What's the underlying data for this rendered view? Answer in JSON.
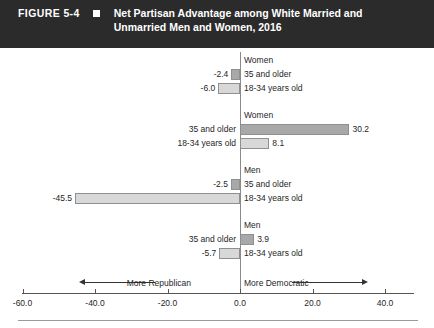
{
  "header": {
    "figure_label": "FIGURE 5-4",
    "marker_icon": "square-bullet-icon",
    "title": "Net Partisan Advantage among White Married and Unmarried Men and Women, 2016",
    "background_color": "#2b2b2b",
    "text_color": "#ffffff"
  },
  "axis_annotation": {
    "left_label": "More Republican",
    "right_label": "More Democratic",
    "left_arrow_icon": "arrow-left-icon",
    "right_arrow_icon": "arrow-right-icon"
  },
  "chart_data": {
    "type": "bar",
    "orientation": "horizontal",
    "title": "Net Partisan Advantage among White Married and Unmarried Men and Women, 2016",
    "xlabel": "",
    "ylabel": "",
    "xlim": [
      -60.0,
      48.0
    ],
    "xticks": [
      -60.0,
      -40.0,
      -20.0,
      0.0,
      20.0,
      40.0
    ],
    "xticklabels": [
      "-60.0",
      "-40.0",
      "-20.0",
      "0.0",
      "20.0",
      "40.0"
    ],
    "grid": false,
    "legend": "none",
    "zero_reference_line": 0.0,
    "series": [
      {
        "name": "35 and older",
        "color": "#a8a8a8"
      },
      {
        "name": "18-34 years old",
        "color": "#d8d8d8"
      }
    ],
    "groups": [
      {
        "marital_status": "Married",
        "gender": "Women",
        "bars": [
          {
            "category": "35 and older",
            "value": -2.4,
            "label": "-2.4",
            "series": "older"
          },
          {
            "category": "18-34 years old",
            "value": -6.0,
            "label": "-6.0",
            "series": "younger"
          }
        ]
      },
      {
        "marital_status": "Single",
        "gender": "Women",
        "bars": [
          {
            "category": "35 and older",
            "value": 30.2,
            "label": "30.2",
            "series": "older"
          },
          {
            "category": "18-34 years old",
            "value": 8.1,
            "label": "8.1",
            "series": "younger"
          }
        ]
      },
      {
        "marital_status": "Married",
        "gender": "Men",
        "bars": [
          {
            "category": "35 and older",
            "value": -2.5,
            "label": "-2.5",
            "series": "older"
          },
          {
            "category": "18-34 years old",
            "value": -45.5,
            "label": "-45.5",
            "series": "younger"
          }
        ]
      },
      {
        "marital_status": "Single",
        "gender": "Men",
        "bars": [
          {
            "category": "35 and older",
            "value": 3.9,
            "label": "3.9",
            "series": "older"
          },
          {
            "category": "18-34 years old",
            "value": -5.7,
            "label": "-5.7",
            "series": "younger"
          }
        ]
      }
    ]
  }
}
